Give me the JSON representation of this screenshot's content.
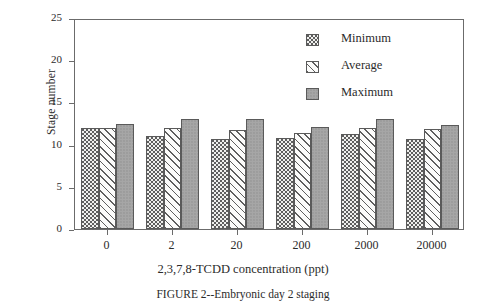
{
  "chart_data": {
    "type": "bar",
    "title": "",
    "caption": "FIGURE 2--Embryonic day 2 staging",
    "xlabel": "2,3,7,8-TCDD concentration (ppt)",
    "ylabel": "Stage number",
    "categories": [
      "0",
      "2",
      "20",
      "200",
      "2000",
      "20000"
    ],
    "series": [
      {
        "name": "Minimum",
        "pattern": "dotted",
        "color": "#f0f0ee",
        "values": [
          12.0,
          11.0,
          10.7,
          10.8,
          11.2,
          10.7
        ]
      },
      {
        "name": "Average",
        "pattern": "hatched",
        "color": "#fbfbfa",
        "values": [
          12.0,
          12.0,
          11.7,
          11.4,
          12.0,
          11.8
        ]
      },
      {
        "name": "Maximum",
        "pattern": "solid",
        "color": "#a6a6a6",
        "values": [
          12.5,
          13.0,
          13.0,
          12.1,
          13.0,
          12.3
        ]
      }
    ],
    "ylim": [
      0,
      25
    ],
    "yticks": [
      "0",
      "5",
      "10",
      "15",
      "20",
      "25"
    ],
    "ytick_values": [
      0,
      5,
      10,
      15,
      20,
      25
    ],
    "grid": false,
    "legend_position": "top-right",
    "frame": true
  },
  "legend": {
    "entries": [
      {
        "label": "Minimum"
      },
      {
        "label": "Average"
      },
      {
        "label": "Maximum"
      }
    ]
  }
}
